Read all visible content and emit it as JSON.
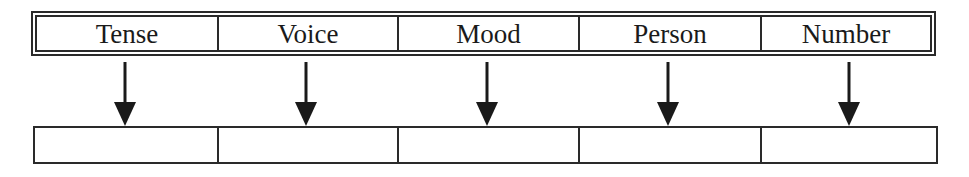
{
  "diagram": {
    "type": "category-to-slot mapping",
    "header": {
      "cells": [
        {
          "label": "Tense"
        },
        {
          "label": "Voice"
        },
        {
          "label": "Mood"
        },
        {
          "label": "Person"
        },
        {
          "label": "Number"
        }
      ]
    },
    "arrows": [
      {
        "from": "Tense",
        "to": "slot-1",
        "direction": "down"
      },
      {
        "from": "Voice",
        "to": "slot-2",
        "direction": "down"
      },
      {
        "from": "Mood",
        "to": "slot-3",
        "direction": "down"
      },
      {
        "from": "Person",
        "to": "slot-4",
        "direction": "down"
      },
      {
        "from": "Number",
        "to": "slot-5",
        "direction": "down"
      }
    ],
    "slots": [
      {
        "value": ""
      },
      {
        "value": ""
      },
      {
        "value": ""
      },
      {
        "value": ""
      },
      {
        "value": ""
      }
    ],
    "colors": {
      "line": "#2a2a2a",
      "text": "#1a1a1a",
      "background": "#ffffff"
    }
  }
}
